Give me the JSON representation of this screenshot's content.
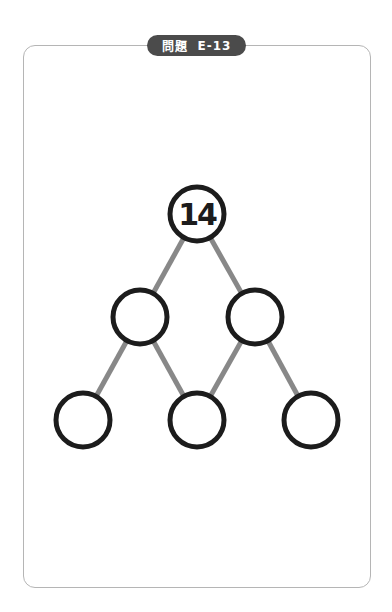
{
  "header": {
    "label": "問題",
    "problem_id": "E-13"
  },
  "puzzle": {
    "type": "number-pyramid",
    "edge_color": "#888888",
    "node_stroke_color": "#1c1c1c",
    "nodes": [
      {
        "id": "top",
        "value": "14",
        "cx": 197,
        "cy": 214
      },
      {
        "id": "mid-left",
        "value": "",
        "cx": 140,
        "cy": 317
      },
      {
        "id": "mid-right",
        "value": "",
        "cx": 255,
        "cy": 317
      },
      {
        "id": "bottom-left",
        "value": "",
        "cx": 83,
        "cy": 420
      },
      {
        "id": "bottom-middle",
        "value": "",
        "cx": 197,
        "cy": 420
      },
      {
        "id": "bottom-right",
        "value": "",
        "cx": 311,
        "cy": 420
      }
    ]
  }
}
